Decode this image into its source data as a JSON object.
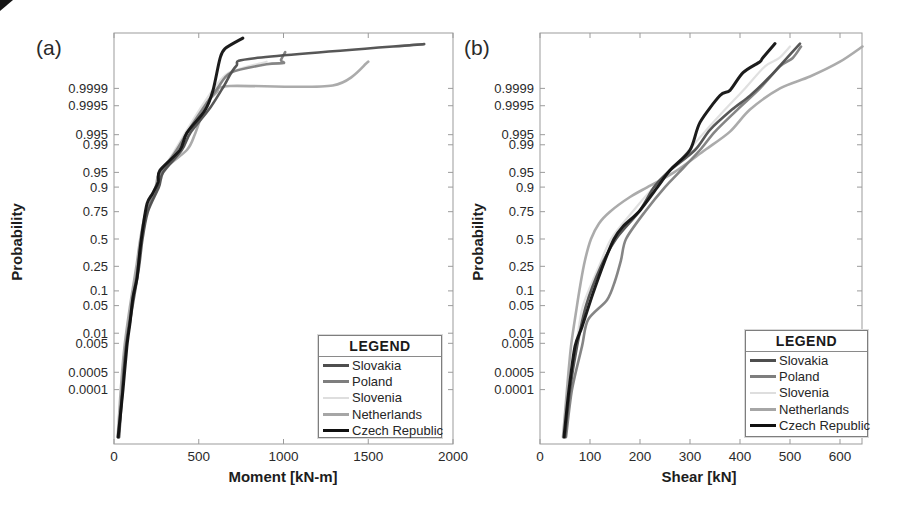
{
  "figure": {
    "panel_a_label": "(a)",
    "panel_b_label": "(b)"
  },
  "legend": {
    "title": "LEGEND",
    "entries": [
      {
        "label": "Slovakia",
        "color": "#4e4e4e",
        "line_width": 3
      },
      {
        "label": "Poland",
        "color": "#7e7e7e",
        "line_width": 3
      },
      {
        "label": "Slovenia",
        "color": "#dedede",
        "line_width": 2
      },
      {
        "label": "Netherlands",
        "color": "#a6a6a6",
        "line_width": 3
      },
      {
        "label": "Czech Republic",
        "color": "#101010",
        "line_width": 3
      }
    ]
  },
  "chart_data": [
    {
      "type": "line",
      "variant": "normal-probability-plot",
      "panel_label": "(a)",
      "xlabel": "Moment [kN-m]",
      "ylabel": "Probability",
      "xlim": [
        0,
        2000
      ],
      "x_ticks": [
        0,
        500,
        1000,
        1500,
        2000
      ],
      "y_tick_labels": [
        "0.9999",
        "0.9995",
        "0.995",
        "0.99",
        "0.95",
        "0.9",
        "0.75",
        "0.5",
        "0.25",
        "0.1",
        "0.05",
        "0.01",
        "0.005",
        "0.0005",
        "0.0001"
      ],
      "grid": false,
      "legend_position": "lower right",
      "series": [
        {
          "name": "Slovenia",
          "color": "#dedede",
          "width": 2.2,
          "points": [
            [
              5e-07,
              26
            ],
            [
              0.0001,
              45
            ],
            [
              0.004,
              68
            ],
            [
              0.05,
              100
            ],
            [
              0.25,
              138
            ],
            [
              0.5,
              158
            ],
            [
              0.75,
              192
            ],
            [
              0.9,
              250
            ],
            [
              0.95,
              278
            ],
            [
              0.986,
              360
            ],
            [
              0.9956,
              420
            ],
            [
              0.9993,
              505
            ],
            [
              0.9999,
              590
            ],
            [
              0.99998,
              680
            ],
            [
              0.999994,
              900
            ]
          ]
        },
        {
          "name": "Netherlands",
          "color": "#a6a6a6",
          "width": 2.6,
          "points": [
            [
              5e-07,
              22
            ],
            [
              0.0001,
              40
            ],
            [
              0.004,
              62
            ],
            [
              0.05,
              95
            ],
            [
              0.25,
              132
            ],
            [
              0.5,
              155
            ],
            [
              0.75,
              188
            ],
            [
              0.9,
              245
            ],
            [
              0.95,
              272
            ],
            [
              0.986,
              430
            ],
            [
              0.9956,
              480
            ],
            [
              0.9995,
              540
            ],
            [
              0.99985,
              605
            ],
            [
              0.999921,
              684
            ],
            [
              0.999925,
              1290
            ],
            [
              0.999994,
              1500
            ]
          ]
        },
        {
          "name": "Poland",
          "color": "#7e7e7e",
          "width": 2.6,
          "points": [
            [
              5e-07,
              27
            ],
            [
              0.0001,
              48
            ],
            [
              0.004,
              70
            ],
            [
              0.05,
              105
            ],
            [
              0.25,
              142
            ],
            [
              0.5,
              163
            ],
            [
              0.75,
              195
            ],
            [
              0.9,
              255
            ],
            [
              0.95,
              282
            ],
            [
              0.986,
              370
            ],
            [
              0.9956,
              430
            ],
            [
              0.9993,
              520
            ],
            [
              0.9999,
              610
            ],
            [
              0.99998,
              690
            ],
            [
              0.999992,
              900
            ],
            [
              0.999993,
              1000
            ],
            [
              0.999995,
              985
            ],
            [
              0.999998,
              1010
            ]
          ]
        },
        {
          "name": "Slovakia",
          "color": "#4e4e4e",
          "width": 2.6,
          "points": [
            [
              5e-07,
              30
            ],
            [
              0.0001,
              50
            ],
            [
              0.004,
              72
            ],
            [
              0.05,
              110
            ],
            [
              0.25,
              148
            ],
            [
              0.5,
              168
            ],
            [
              0.75,
              200
            ],
            [
              0.9,
              265
            ],
            [
              0.95,
              290
            ],
            [
              0.986,
              400
            ],
            [
              0.9956,
              450
            ],
            [
              0.9993,
              560
            ],
            [
              0.9999,
              640
            ],
            [
              0.99999,
              720
            ],
            [
              0.999996,
              830
            ],
            [
              0.99999925,
              1830
            ]
          ]
        },
        {
          "name": "Czech Republic",
          "color": "#101010",
          "width": 3,
          "points": [
            [
              5e-07,
              24
            ],
            [
              0.0001,
              53
            ],
            [
              0.004,
              76
            ],
            [
              0.02,
              95
            ],
            [
              0.076,
              112
            ],
            [
              0.17,
              136
            ],
            [
              0.39,
              153
            ],
            [
              0.62,
              171
            ],
            [
              0.81,
              195
            ],
            [
              0.87,
              228
            ],
            [
              0.92,
              260
            ],
            [
              0.955,
              271
            ],
            [
              0.986,
              389
            ],
            [
              0.9956,
              430
            ],
            [
              0.99926,
              537
            ],
            [
              0.99988,
              584
            ],
            [
              0.9999957,
              625
            ],
            [
              0.9999987,
              655
            ],
            [
              0.99999965,
              760
            ]
          ]
        }
      ]
    },
    {
      "type": "line",
      "variant": "normal-probability-plot",
      "panel_label": "(b)",
      "xlabel": "Shear [kN]",
      "ylabel": "Probability",
      "xlim": [
        0,
        644
      ],
      "x_ticks": [
        0,
        100,
        200,
        300,
        400,
        500,
        600
      ],
      "y_tick_labels": [
        "0.9999",
        "0.9995",
        "0.995",
        "0.99",
        "0.95",
        "0.9",
        "0.75",
        "0.5",
        "0.25",
        "0.1",
        "0.05",
        "0.01",
        "0.005",
        "0.0005",
        "0.0001"
      ],
      "grid": false,
      "legend_position": "lower right",
      "series": [
        {
          "name": "Slovenia",
          "color": "#dedede",
          "width": 2.2,
          "points": [
            [
              5e-07,
              49
            ],
            [
              0.0001,
              59
            ],
            [
              0.004,
              72
            ],
            [
              0.05,
              86
            ],
            [
              0.25,
              118
            ],
            [
              0.5,
              142
            ],
            [
              0.75,
              185
            ],
            [
              0.9,
              228
            ],
            [
              0.95,
              258
            ],
            [
              0.986,
              298
            ],
            [
              0.996,
              330
            ],
            [
              0.9993,
              370
            ],
            [
              0.9999,
              410
            ],
            [
              0.99999,
              450
            ],
            [
              0.999996,
              478
            ],
            [
              0.999999,
              500
            ]
          ]
        },
        {
          "name": "Netherlands",
          "color": "#a6a6a6",
          "width": 2.6,
          "points": [
            [
              5e-07,
              46
            ],
            [
              0.0001,
              54
            ],
            [
              0.004,
              62
            ],
            [
              0.05,
              74
            ],
            [
              0.15,
              82
            ],
            [
              0.3,
              90
            ],
            [
              0.5,
              102
            ],
            [
              0.65,
              118
            ],
            [
              0.75,
              140
            ],
            [
              0.85,
              180
            ],
            [
              0.9,
              215
            ],
            [
              0.95,
              268
            ],
            [
              0.986,
              330
            ],
            [
              0.996,
              380
            ],
            [
              0.9993,
              420
            ],
            [
              0.9999,
              480
            ],
            [
              0.99997,
              540
            ],
            [
              0.999994,
              600
            ],
            [
              0.999999,
              645
            ]
          ]
        },
        {
          "name": "Poland",
          "color": "#7e7e7e",
          "width": 2.6,
          "points": [
            [
              5e-07,
              52
            ],
            [
              0.0001,
              64
            ],
            [
              0.004,
              84
            ],
            [
              0.023,
              96
            ],
            [
              0.066,
              134
            ],
            [
              0.15,
              150
            ],
            [
              0.3,
              162
            ],
            [
              0.5,
              172
            ],
            [
              0.75,
              210
            ],
            [
              0.9,
              250
            ],
            [
              0.95,
              278
            ],
            [
              0.986,
              320
            ],
            [
              0.996,
              350
            ],
            [
              0.9993,
              395
            ],
            [
              0.9999,
              440
            ],
            [
              0.99999,
              480
            ],
            [
              0.999996,
              505
            ],
            [
              0.999999,
              522
            ]
          ]
        },
        {
          "name": "Slovakia",
          "color": "#4e4e4e",
          "width": 2.6,
          "points": [
            [
              5e-07,
              50
            ],
            [
              0.0001,
              60
            ],
            [
              0.004,
              74
            ],
            [
              0.05,
              92
            ],
            [
              0.25,
              122
            ],
            [
              0.5,
              152
            ],
            [
              0.75,
              198
            ],
            [
              0.9,
              228
            ],
            [
              0.95,
              255
            ],
            [
              0.986,
              310
            ],
            [
              0.9965,
              340
            ],
            [
              0.9993,
              384
            ],
            [
              0.9998,
              420
            ],
            [
              0.99997,
              460
            ],
            [
              0.999995,
              490
            ],
            [
              0.9999993,
              520
            ]
          ]
        },
        {
          "name": "Czech Republic",
          "color": "#101010",
          "width": 3,
          "points": [
            [
              5e-07,
              48
            ],
            [
              0.0001,
              58
            ],
            [
              0.004,
              70
            ],
            [
              0.015,
              84
            ],
            [
              0.09,
              106
            ],
            [
              0.3,
              130
            ],
            [
              0.5,
              148
            ],
            [
              0.62,
              166
            ],
            [
              0.76,
              200
            ],
            [
              0.9,
              235
            ],
            [
              0.955,
              260
            ],
            [
              0.986,
              300
            ],
            [
              0.998,
              320
            ],
            [
              0.9998,
              360
            ],
            [
              0.99988,
              380
            ],
            [
              0.99998,
              406
            ],
            [
              0.999994,
              440
            ],
            [
              0.999996,
              445
            ],
            [
              0.9999993,
              470
            ]
          ]
        }
      ]
    }
  ]
}
